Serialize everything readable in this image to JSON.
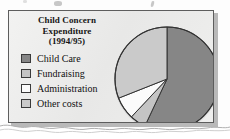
{
  "figure": {
    "title_lines": [
      "Child Concern",
      "Expenditure",
      "(1994/95)"
    ],
    "title_text": "Child Concern Expenditure (1994/95)"
  },
  "legend": {
    "items": [
      {
        "label": "Child Care",
        "color": "#868686"
      },
      {
        "label": "Fundraising",
        "color": "#c4c4c4"
      },
      {
        "label": "Administration",
        "color": "#fbfbfb"
      },
      {
        "label": "Other costs",
        "color": "#cacaca"
      }
    ]
  },
  "colors": {
    "frame_border": "#5d5d5d",
    "frame_fill": "#ececeb",
    "page": "#fdfdfd",
    "slice_outline": "#333333",
    "shadow": "#b9b9b9"
  },
  "chart_data": {
    "type": "pie",
    "title": "Child Concern Expenditure (1994/95)",
    "xlabel": "",
    "ylabel": "",
    "categories": [
      "Child Care",
      "Fundraising",
      "Administration",
      "Other costs"
    ],
    "values": [
      57,
      5,
      7,
      31
    ],
    "units": "percent",
    "colors": [
      "#868686",
      "#c4c4c4",
      "#fbfbfb",
      "#cacaca"
    ],
    "start_angle_deg": 0,
    "direction": "clockwise",
    "legend_position": "left",
    "grid": false,
    "labels_shown": false
  }
}
